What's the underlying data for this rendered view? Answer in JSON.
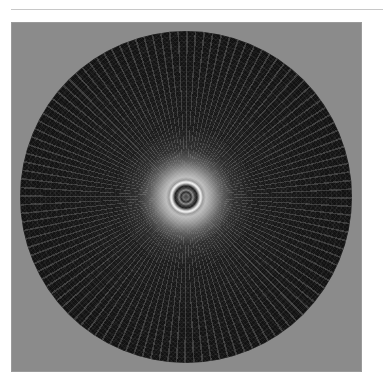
{
  "caption": {
    "text": "",
    "note": ""
  },
  "figure": {
    "background_color": "#8b8b8b",
    "disc_color": "#111111",
    "center_highlight_color": "#f0f0f0",
    "page_background": "#ffffff"
  }
}
